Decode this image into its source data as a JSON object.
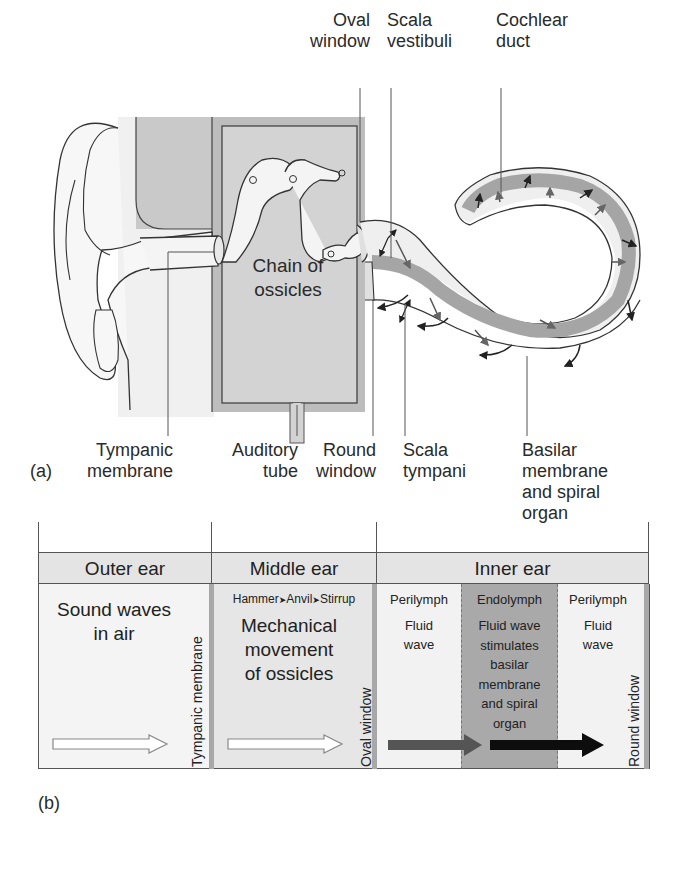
{
  "figure": {
    "panel_a_label": "(a)",
    "panel_b_label": "(b)"
  },
  "panel_a": {
    "labels": {
      "oval_window": "Oval\nwindow",
      "scala_vestibuli": "Scala\nvestibuli",
      "cochlear_duct": "Cochlear\nduct",
      "chain_of_ossicles": "Chain of\nossicles",
      "tympanic_membrane": "Tympanic\nmembrane",
      "auditory_tube": "Auditory\ntube",
      "round_window": "Round\nwindow",
      "scala_tympani": "Scala\ntympani",
      "basilar_membrane": "Basilar\nmembrane\nand spiral\norgan"
    }
  },
  "panel_b": {
    "headers": {
      "outer": "Outer ear",
      "middle": "Middle ear",
      "inner": "Inner ear"
    },
    "outer": {
      "text": "Sound waves\nin air",
      "boundary": "Tympanic membrane"
    },
    "middle": {
      "chain": [
        "Hammer",
        "Anvil",
        "Stirrup"
      ],
      "chain_arrow": "➤",
      "text": "Mechanical\nmovement\nof ossicles",
      "boundary": "Oval window"
    },
    "inner": {
      "perilymph1": {
        "title": "Perilymph",
        "text": "Fluid\nwave"
      },
      "endolymph": {
        "title": "Endolymph",
        "text": "Fluid wave\nstimulates\nbasilar\nmembrane\nand spiral\norgan"
      },
      "perilymph2": {
        "title": "Perilymph",
        "text": "Fluid\nwave"
      },
      "boundary": "Round window"
    },
    "colors": {
      "outer_bg": "#f4f4f4",
      "middle_bg": "#e6e6e6",
      "perilymph_bg": "#f2f2f2",
      "endolymph_bg": "#a9a9a9",
      "header_bg": "#e4e4e4",
      "arrow_dark_gray": "#555555",
      "arrow_black": "#0d0d0d"
    }
  }
}
